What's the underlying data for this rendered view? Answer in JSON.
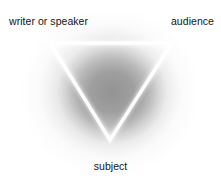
{
  "diagram": {
    "shape": "inverted-triangle",
    "stroke_color": "#ffffff",
    "background_center_color": "#8c8c8c",
    "background_edge_color": "#ffffff",
    "label_color": "#141414",
    "labels": {
      "top_left": "writer or speaker",
      "top_right": "audience",
      "bottom": "subject"
    },
    "vertices": {
      "top_left": {
        "x": 50,
        "y": 43
      },
      "top_right": {
        "x": 172,
        "y": 43
      },
      "bottom": {
        "x": 110,
        "y": 140
      }
    }
  }
}
